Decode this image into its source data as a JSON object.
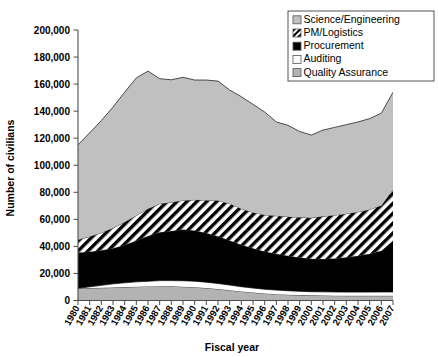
{
  "chart_data": {
    "type": "area",
    "title": "",
    "xlabel": "Fiscal year",
    "ylabel": "Number of civilians",
    "stacked": true,
    "grid": false,
    "legend_position": "top-right",
    "ylim": [
      0,
      200000
    ],
    "ytick_labels": [
      "0",
      "20,000",
      "40,000",
      "60,000",
      "80,000",
      "100,000",
      "120,000",
      "140,000",
      "160,000",
      "180,000",
      "200,000"
    ],
    "ytick_values": [
      0,
      20000,
      40000,
      60000,
      80000,
      100000,
      120000,
      140000,
      160000,
      180000,
      200000
    ],
    "categories": [
      "1980",
      "1981",
      "1982",
      "1983",
      "1984",
      "1985",
      "1986",
      "1987",
      "1988",
      "1989",
      "1990",
      "1991",
      "1992",
      "1993",
      "1994",
      "1995",
      "1996",
      "1997",
      "1998",
      "1999",
      "2000",
      "2001",
      "2002",
      "2003",
      "2004",
      "2005",
      "2006",
      "2007"
    ],
    "series": [
      {
        "name": "Quality Assurance",
        "fill": "#b3b3b3",
        "pattern": "solid-gray",
        "values": [
          9000,
          9200,
          9400,
          9600,
          9900,
          10200,
          10400,
          10600,
          10500,
          10200,
          9800,
          9200,
          8500,
          7600,
          6700,
          5900,
          5200,
          4700,
          4300,
          4000,
          3800,
          3700,
          3600,
          3500,
          3500,
          3500,
          3500,
          3500
        ]
      },
      {
        "name": "Auditing",
        "fill": "#ffffff",
        "pattern": "solid-white",
        "values": [
          0,
          900,
          1800,
          2700,
          3200,
          3600,
          3800,
          4100,
          4200,
          4400,
          4500,
          4300,
          4100,
          3800,
          3500,
          3300,
          3100,
          3000,
          2900,
          2800,
          2700,
          2700,
          2700,
          2700,
          2700,
          2700,
          2800,
          2800
        ]
      },
      {
        "name": "Procurement",
        "fill": "#000000",
        "pattern": "solid-black",
        "values": [
          26500,
          26000,
          25900,
          26300,
          28000,
          30500,
          33500,
          35800,
          36700,
          37900,
          37500,
          36400,
          34900,
          33000,
          31000,
          29500,
          28000,
          26800,
          25800,
          25000,
          24300,
          24300,
          24800,
          25700,
          26800,
          28300,
          30500,
          37800
        ]
      },
      {
        "name": "PM/Logistics",
        "fill": "#ffffff",
        "pattern": "diagonal-stripe",
        "values": [
          9500,
          11200,
          13000,
          15000,
          16900,
          18600,
          20100,
          21000,
          21200,
          21500,
          22600,
          24300,
          26500,
          27200,
          26700,
          26400,
          27000,
          28100,
          29000,
          29700,
          30300,
          31500,
          32000,
          32300,
          32500,
          32800,
          33500,
          37900
        ]
      },
      {
        "name": "Science/Engineering",
        "fill": "#c0c0c0",
        "pattern": "solid-lightgray",
        "values": [
          70000,
          76700,
          82900,
          89400,
          96000,
          101700,
          101800,
          92500,
          90600,
          91000,
          88600,
          88800,
          88200,
          84000,
          82800,
          79900,
          76100,
          69400,
          67500,
          63500,
          61200,
          63800,
          64900,
          65800,
          66500,
          67200,
          68200,
          72000
        ]
      }
    ],
    "annotations": []
  },
  "legend": {
    "items": [
      {
        "label": "Science/Engineering",
        "swatch": "light-gray-square"
      },
      {
        "label": "PM/Logistics",
        "swatch": "diagonal-stripe-square"
      },
      {
        "label": "Procurement",
        "swatch": "black-square"
      },
      {
        "label": "Auditing",
        "swatch": "white-square"
      },
      {
        "label": "Quality Assurance",
        "swatch": "mid-gray-square"
      }
    ]
  },
  "colors": {
    "science_engineering": "#c0c0c0",
    "pm_logistics": "#ffffff",
    "procurement": "#000000",
    "auditing": "#ffffff",
    "quality_assurance": "#b3b3b3",
    "axis": "#4d4d4d",
    "outline": "#3a3a3a",
    "text": "#000000"
  }
}
